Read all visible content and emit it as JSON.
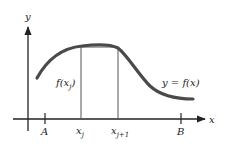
{
  "diagram": {
    "axes": {
      "x_label": "x",
      "y_label": "y"
    },
    "curve_label": "y = f(x)",
    "rect_height_label": "f(x",
    "rect_height_sub": "j",
    "rect_height_close": ")",
    "ticks": {
      "A": "A",
      "B": "B"
    },
    "partition": {
      "left_base": "x",
      "left_sub": "j",
      "right_base": "x",
      "right_sub": "j+1"
    },
    "colors": {
      "curve": "#4a4a4a",
      "axis": "#222222",
      "rect": "#555555"
    }
  }
}
